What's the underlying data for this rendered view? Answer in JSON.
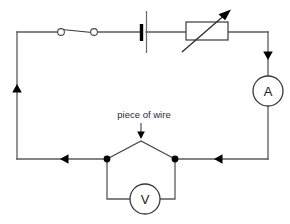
{
  "diagram": {
    "background_color": "#ffffff",
    "wire_color": "#5a5a5a",
    "accent_color": "#000000",
    "annotations": [
      {
        "id": "piece-of-wire",
        "text": "piece of wire",
        "points_to": "wire-peak-apex"
      }
    ],
    "components": [
      {
        "id": "switch",
        "type": "open-switch",
        "label": "",
        "position": "top-branch-left"
      },
      {
        "id": "battery",
        "type": "cell",
        "label": "",
        "position": "top-branch-middle"
      },
      {
        "id": "variable-resistor",
        "type": "rheostat",
        "label": "",
        "position": "top-branch-right"
      },
      {
        "id": "ammeter",
        "type": "meter",
        "label": "A",
        "position": "right-branch"
      },
      {
        "id": "voltmeter",
        "type": "meter",
        "label": "V",
        "position": "bottom-parallel-branch"
      }
    ],
    "current_arrows": [
      {
        "id": "arrow-right-down",
        "direction": "down",
        "position": "right-branch-top"
      },
      {
        "id": "arrow-bottom-right",
        "direction": "left",
        "position": "bottom-branch-right"
      },
      {
        "id": "arrow-bottom-left",
        "direction": "left",
        "position": "bottom-branch-left"
      },
      {
        "id": "arrow-left-up",
        "direction": "up",
        "position": "left-branch"
      }
    ],
    "junction_nodes": [
      {
        "id": "node-left",
        "position": "bottom-wire-left-of-peak"
      },
      {
        "id": "node-right",
        "position": "bottom-wire-right-of-peak"
      }
    ],
    "meters": {
      "ammeter_label": "A",
      "voltmeter_label": "V"
    }
  }
}
